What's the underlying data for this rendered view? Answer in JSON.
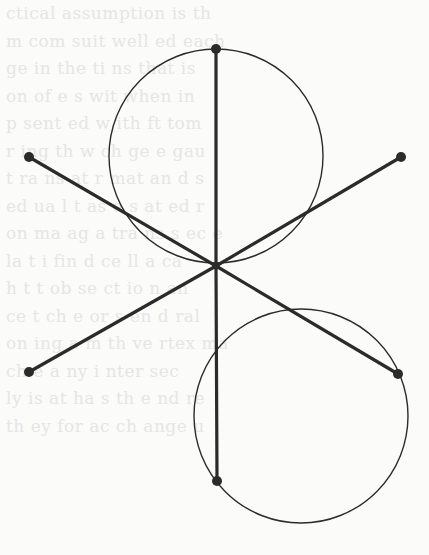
{
  "diagram": {
    "colors": {
      "background": "#fbfbfa",
      "ink": "#2b2b2b",
      "bleed_text": "#e6e6e4"
    },
    "center": {
      "x": 216,
      "y": 266
    },
    "segments": [
      {
        "id": "up",
        "x1": 216,
        "y1": 266,
        "x2": 216,
        "y2": 49
      },
      {
        "id": "down",
        "x1": 216,
        "y1": 266,
        "x2": 217,
        "y2": 481
      },
      {
        "id": "upper-left",
        "x1": 216,
        "y1": 266,
        "x2": 29,
        "y2": 157
      },
      {
        "id": "upper-right",
        "x1": 216,
        "y1": 266,
        "x2": 401,
        "y2": 157
      },
      {
        "id": "lower-left",
        "x1": 216,
        "y1": 266,
        "x2": 29,
        "y2": 372
      },
      {
        "id": "lower-right",
        "x1": 216,
        "y1": 266,
        "x2": 398,
        "y2": 374
      }
    ],
    "endpoints": [
      {
        "id": "up",
        "x": 216,
        "y": 49
      },
      {
        "id": "down",
        "x": 217,
        "y": 481
      },
      {
        "id": "upper-left",
        "x": 29,
        "y": 157
      },
      {
        "id": "upper-right",
        "x": 401,
        "y": 157
      },
      {
        "id": "lower-left",
        "x": 29,
        "y": 372
      },
      {
        "id": "lower-right",
        "x": 398,
        "y": 374
      }
    ],
    "circles": [
      {
        "id": "upper-circle",
        "cx": 216,
        "cy": 156,
        "r": 107
      },
      {
        "id": "lower-circle",
        "cx": 301,
        "cy": 416,
        "r": 107
      }
    ]
  },
  "bleed_lines": [
    "  ",
    "  ",
    "                 ctical assumption is th              ",
    "                  m  com  suit  well   ed  each       ",
    "                  ge  in  the  ti   ns  that  is     ",
    "                  on  of  e   s  wit   when  in     ",
    "                   p  sent  ed   w   ith  ft  tom   ",
    "                    r  ing  th  w    ch  ge  e  gau ",
    "                   t  ra  ns  at  r   mat  an  d  s  ",
    "                  ed  ua  l  t  as  e  s  at   ed  r  ",
    "                  on  ma  ag  a  tra  ns  s  ec   e  ",
    "                  la  t  i  fin  d  ce  ll  a  ca  ",
    "                  h  t  t  ob  se  ct  io  n  an   ",
    "                  ce  t  ch  e  or  s  en  d  ral  ",
    "                  on  ing  a  m  th  ve  rtex  ma   ",
    "                  ch  e   a  ny  i  nter  sec    ",
    "                  ly  is  at  ha  s  th  e  nd  re   ",
    "                  th  ey  for  ac  ch  ange  u     ",
    "                   ",
    "                  "
  ]
}
